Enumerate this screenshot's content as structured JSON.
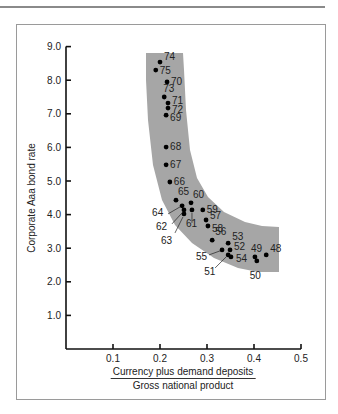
{
  "chart_data": {
    "type": "scatter",
    "title": "",
    "xlabel": "Currency plus demand deposits / Gross national product",
    "xlabel_numerator": "Currency plus demand deposits",
    "xlabel_denominator": "Gross national product",
    "ylabel": "Corporate Aaa bond rate",
    "xlim": [
      0,
      0.5
    ],
    "ylim": [
      0,
      9.0
    ],
    "x_ticks": [
      "0.1",
      "0.2",
      "0.3",
      "0.4",
      "0.5"
    ],
    "y_ticks": [
      "1.0",
      "2.0",
      "3.0",
      "4.0",
      "5.0",
      "6.0",
      "7.0",
      "8.0",
      "9.0"
    ],
    "grid": false,
    "legend": null,
    "annotations": "Points labeled by year (19xx); shaded curved band highlights the inverse relationship",
    "band_color": "#a6a6a6",
    "point_color": "#000000",
    "points": [
      {
        "label": "74",
        "x": 0.2,
        "y": 8.54
      },
      {
        "label": "75",
        "x": 0.191,
        "y": 8.3
      },
      {
        "label": "70",
        "x": 0.215,
        "y": 7.95
      },
      {
        "label": "73",
        "x": 0.209,
        "y": 7.5
      },
      {
        "label": "71",
        "x": 0.217,
        "y": 7.32
      },
      {
        "label": "72",
        "x": 0.217,
        "y": 7.17
      },
      {
        "label": "69",
        "x": 0.213,
        "y": 6.96
      },
      {
        "label": "68",
        "x": 0.213,
        "y": 6.01
      },
      {
        "label": "67",
        "x": 0.213,
        "y": 5.48
      },
      {
        "label": "66",
        "x": 0.221,
        "y": 4.97
      },
      {
        "label": "65",
        "x": 0.234,
        "y": 4.43
      },
      {
        "label": "64",
        "x": 0.247,
        "y": 4.26
      },
      {
        "label": "62",
        "x": 0.251,
        "y": 4.14
      },
      {
        "label": "63",
        "x": 0.251,
        "y": 4.02
      },
      {
        "label": "60",
        "x": 0.266,
        "y": 4.35
      },
      {
        "label": "61",
        "x": 0.268,
        "y": 4.14
      },
      {
        "label": "59",
        "x": 0.291,
        "y": 4.14
      },
      {
        "label": "57",
        "x": 0.298,
        "y": 3.84
      },
      {
        "label": "58",
        "x": 0.302,
        "y": 3.66
      },
      {
        "label": "56",
        "x": 0.311,
        "y": 3.24
      },
      {
        "label": "53",
        "x": 0.345,
        "y": 3.15
      },
      {
        "label": "55",
        "x": 0.332,
        "y": 2.95
      },
      {
        "label": "52",
        "x": 0.349,
        "y": 2.95
      },
      {
        "label": "51",
        "x": 0.345,
        "y": 2.8
      },
      {
        "label": "54",
        "x": 0.351,
        "y": 2.74
      },
      {
        "label": "49",
        "x": 0.402,
        "y": 2.74
      },
      {
        "label": "50",
        "x": 0.406,
        "y": 2.62
      },
      {
        "label": "48",
        "x": 0.426,
        "y": 2.8
      }
    ]
  },
  "labels": {
    "ylabel": "Corporate Aaa bond rate",
    "xlabel_num": "Currency plus demand deposits",
    "xlabel_den": "Gross national product"
  }
}
